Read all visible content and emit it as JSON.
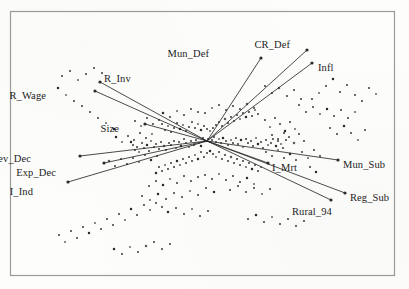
{
  "figure": {
    "kind": "biplot",
    "frame": {
      "x": 10,
      "y": 11,
      "width": 385,
      "height": 265,
      "color": "#9a9a9a"
    },
    "background_color": "#fdfdfc",
    "point_color": "#1a1a1a",
    "vector_color": "#2b2b2b"
  },
  "chart_data": {
    "type": "scatter",
    "title": "",
    "subtitle": "",
    "xlabel": "",
    "ylabel": "",
    "grid": false,
    "legend": "none",
    "axis_ticks_visible": false,
    "origin_px": [
      207,
      141
    ],
    "xlim": [
      10,
      395
    ],
    "ylim": [
      11,
      276
    ],
    "variable_labels": [
      "Mun_Def",
      "CR_Def",
      "Infl",
      "R_Inv",
      "R_Wage",
      "Size",
      "Rev_Dec",
      "Exp_Dec",
      "I_Ind",
      "I_Mrt",
      "Mun_Sub",
      "Reg_Sub",
      "Rural_94"
    ],
    "loading_vectors": [
      {
        "label": "Mun_Def",
        "tip_px": [
          261,
          58
        ],
        "label_px": [
          209,
          54
        ],
        "anchor": "end"
      },
      {
        "label": "CR_Def",
        "tip_px": [
          307,
          50
        ],
        "label_px": [
          290,
          45
        ],
        "anchor": "end"
      },
      {
        "label": "Infl",
        "tip_px": [
          312,
          63
        ],
        "label_px": [
          318,
          68
        ],
        "anchor": "start"
      },
      {
        "label": "R_Inv",
        "tip_px": [
          100,
          82
        ],
        "label_px": [
          104,
          79
        ],
        "anchor": "start"
      },
      {
        "label": "R_Wage",
        "tip_px": [
          95,
          91
        ],
        "label_px": [
          46,
          96
        ],
        "anchor": "end"
      },
      {
        "label": "Size",
        "tip_px": [
          145,
          124
        ],
        "label_px": [
          119,
          129
        ],
        "anchor": "end"
      },
      {
        "label": "Rev_Dec",
        "tip_px": [
          80,
          156
        ],
        "label_px": [
          31,
          159
        ],
        "anchor": "end"
      },
      {
        "label": "Exp_Dec",
        "tip_px": [
          104,
          163
        ],
        "label_px": [
          56,
          173
        ],
        "anchor": "end"
      },
      {
        "label": "I_Ind",
        "tip_px": [
          68,
          182
        ],
        "label_px": [
          33,
          192
        ],
        "anchor": "end"
      },
      {
        "label": "I_Mrt",
        "tip_px": [
          268,
          163
        ],
        "label_px": [
          272,
          168
        ],
        "anchor": "start"
      },
      {
        "label": "Mun_Sub",
        "tip_px": [
          338,
          160
        ],
        "label_px": [
          343,
          165
        ],
        "anchor": "start"
      },
      {
        "label": "Reg_Sub",
        "tip_px": [
          345,
          193
        ],
        "label_px": [
          350,
          198
        ],
        "anchor": "start"
      },
      {
        "label": "Rural_94",
        "tip_px": [
          331,
          200
        ],
        "label_px": [
          292,
          212
        ],
        "anchor": "start"
      }
    ],
    "n_points": 252,
    "points_px": [
      [
        205,
        141
      ],
      [
        208,
        139
      ],
      [
        210,
        142
      ],
      [
        203,
        138
      ],
      [
        212,
        140
      ],
      [
        199,
        143
      ],
      [
        214,
        137
      ],
      [
        201,
        146
      ],
      [
        216,
        142
      ],
      [
        196,
        140
      ],
      [
        219,
        139
      ],
      [
        194,
        145
      ],
      [
        221,
        143
      ],
      [
        191,
        141
      ],
      [
        223,
        138
      ],
      [
        189,
        147
      ],
      [
        226,
        141
      ],
      [
        186,
        143
      ],
      [
        228,
        145
      ],
      [
        184,
        139
      ],
      [
        231,
        140
      ],
      [
        181,
        146
      ],
      [
        233,
        143
      ],
      [
        179,
        142
      ],
      [
        236,
        138
      ],
      [
        176,
        148
      ],
      [
        238,
        144
      ],
      [
        174,
        141
      ],
      [
        241,
        140
      ],
      [
        171,
        145
      ],
      [
        243,
        147
      ],
      [
        169,
        143
      ],
      [
        246,
        139
      ],
      [
        166,
        150
      ],
      [
        248,
        143
      ],
      [
        164,
        146
      ],
      [
        251,
        141
      ],
      [
        161,
        142
      ],
      [
        253,
        146
      ],
      [
        159,
        149
      ],
      [
        256,
        138
      ],
      [
        156,
        144
      ],
      [
        258,
        144
      ],
      [
        154,
        147
      ],
      [
        261,
        142
      ],
      [
        151,
        141
      ],
      [
        263,
        148
      ],
      [
        149,
        151
      ],
      [
        266,
        140
      ],
      [
        147,
        145
      ],
      [
        268,
        145
      ],
      [
        144,
        148
      ],
      [
        271,
        143
      ],
      [
        142,
        143
      ],
      [
        273,
        139
      ],
      [
        139,
        152
      ],
      [
        276,
        146
      ],
      [
        137,
        147
      ],
      [
        278,
        141
      ],
      [
        135,
        150
      ],
      [
        281,
        144
      ],
      [
        133,
        145
      ],
      [
        283,
        148
      ],
      [
        131,
        142
      ],
      [
        286,
        140
      ],
      [
        210,
        131
      ],
      [
        213,
        128
      ],
      [
        216,
        125
      ],
      [
        219,
        122
      ],
      [
        222,
        126
      ],
      [
        225,
        119
      ],
      [
        228,
        123
      ],
      [
        231,
        117
      ],
      [
        234,
        121
      ],
      [
        237,
        115
      ],
      [
        240,
        119
      ],
      [
        243,
        113
      ],
      [
        246,
        117
      ],
      [
        249,
        112
      ],
      [
        252,
        116
      ],
      [
        255,
        110
      ],
      [
        258,
        114
      ],
      [
        207,
        129
      ],
      [
        204,
        126
      ],
      [
        201,
        130
      ],
      [
        198,
        124
      ],
      [
        195,
        128
      ],
      [
        192,
        122
      ],
      [
        189,
        127
      ],
      [
        186,
        131
      ],
      [
        183,
        125
      ],
      [
        180,
        129
      ],
      [
        177,
        123
      ],
      [
        174,
        128
      ],
      [
        171,
        132
      ],
      [
        168,
        126
      ],
      [
        165,
        130
      ],
      [
        162,
        124
      ],
      [
        210,
        151
      ],
      [
        213,
        154
      ],
      [
        216,
        157
      ],
      [
        219,
        152
      ],
      [
        222,
        159
      ],
      [
        225,
        155
      ],
      [
        228,
        161
      ],
      [
        231,
        157
      ],
      [
        234,
        163
      ],
      [
        237,
        159
      ],
      [
        240,
        165
      ],
      [
        243,
        161
      ],
      [
        246,
        167
      ],
      [
        249,
        163
      ],
      [
        252,
        169
      ],
      [
        255,
        165
      ],
      [
        258,
        171
      ],
      [
        261,
        167
      ],
      [
        207,
        153
      ],
      [
        204,
        157
      ],
      [
        201,
        152
      ],
      [
        198,
        159
      ],
      [
        195,
        155
      ],
      [
        192,
        161
      ],
      [
        189,
        157
      ],
      [
        186,
        163
      ],
      [
        183,
        159
      ],
      [
        180,
        165
      ],
      [
        177,
        161
      ],
      [
        174,
        167
      ],
      [
        171,
        163
      ],
      [
        168,
        169
      ],
      [
        165,
        165
      ],
      [
        162,
        171
      ],
      [
        159,
        167
      ],
      [
        156,
        173
      ],
      [
        205,
        113
      ],
      [
        212,
        108
      ],
      [
        219,
        105
      ],
      [
        226,
        110
      ],
      [
        233,
        106
      ],
      [
        240,
        109
      ],
      [
        247,
        104
      ],
      [
        254,
        108
      ],
      [
        198,
        112
      ],
      [
        191,
        109
      ],
      [
        184,
        115
      ],
      [
        177,
        111
      ],
      [
        170,
        117
      ],
      [
        163,
        113
      ],
      [
        205,
        175
      ],
      [
        212,
        179
      ],
      [
        219,
        174
      ],
      [
        226,
        180
      ],
      [
        233,
        176
      ],
      [
        240,
        182
      ],
      [
        247,
        178
      ],
      [
        254,
        184
      ],
      [
        198,
        177
      ],
      [
        191,
        181
      ],
      [
        184,
        176
      ],
      [
        177,
        183
      ],
      [
        170,
        179
      ],
      [
        163,
        185
      ],
      [
        156,
        181
      ],
      [
        149,
        186
      ],
      [
        265,
        120
      ],
      [
        270,
        127
      ],
      [
        275,
        118
      ],
      [
        280,
        124
      ],
      [
        285,
        131
      ],
      [
        290,
        122
      ],
      [
        295,
        129
      ],
      [
        272,
        135
      ],
      [
        278,
        139
      ],
      [
        284,
        133
      ],
      [
        289,
        137
      ],
      [
        294,
        143
      ],
      [
        299,
        134
      ],
      [
        304,
        141
      ],
      [
        266,
        152
      ],
      [
        272,
        156
      ],
      [
        278,
        150
      ],
      [
        284,
        158
      ],
      [
        290,
        154
      ],
      [
        296,
        160
      ],
      [
        302,
        152
      ],
      [
        308,
        158
      ],
      [
        314,
        150
      ],
      [
        320,
        156
      ],
      [
        310,
        167
      ],
      [
        316,
        172
      ],
      [
        152,
        134
      ],
      [
        146,
        138
      ],
      [
        140,
        133
      ],
      [
        134,
        140
      ],
      [
        128,
        136
      ],
      [
        122,
        142
      ],
      [
        116,
        137
      ],
      [
        159,
        120
      ],
      [
        153,
        124
      ],
      [
        147,
        118
      ],
      [
        141,
        126
      ],
      [
        135,
        121
      ],
      [
        157,
        156
      ],
      [
        151,
        160
      ],
      [
        145,
        155
      ],
      [
        139,
        162
      ],
      [
        133,
        158
      ],
      [
        127,
        164
      ],
      [
        121,
        159
      ],
      [
        115,
        166
      ],
      [
        109,
        161
      ],
      [
        230,
        190
      ],
      [
        238,
        186
      ],
      [
        246,
        192
      ],
      [
        254,
        188
      ],
      [
        262,
        194
      ],
      [
        270,
        189
      ],
      [
        214,
        192
      ],
      [
        206,
        188
      ],
      [
        198,
        195
      ],
      [
        190,
        191
      ],
      [
        182,
        197
      ],
      [
        174,
        193
      ],
      [
        166,
        199
      ],
      [
        158,
        194
      ],
      [
        150,
        200
      ],
      [
        142,
        196
      ],
      [
        299,
        105
      ],
      [
        306,
        112
      ],
      [
        313,
        107
      ],
      [
        320,
        114
      ],
      [
        327,
        109
      ],
      [
        334,
        116
      ],
      [
        341,
        110
      ],
      [
        348,
        118
      ],
      [
        355,
        112
      ],
      [
        330,
        128
      ],
      [
        337,
        134
      ],
      [
        344,
        126
      ],
      [
        351,
        133
      ],
      [
        358,
        140
      ],
      [
        365,
        130
      ],
      [
        287,
        96
      ],
      [
        294,
        90
      ],
      [
        301,
        99
      ],
      [
        279,
        88
      ],
      [
        272,
        93
      ],
      [
        265,
        86
      ],
      [
        156,
        203
      ],
      [
        162,
        207
      ],
      [
        150,
        210
      ],
      [
        144,
        205
      ],
      [
        168,
        212
      ],
      [
        176,
        208
      ],
      [
        184,
        214
      ],
      [
        192,
        209
      ],
      [
        200,
        216
      ],
      [
        208,
        211
      ],
      [
        137,
        215
      ],
      [
        131,
        209
      ],
      [
        125,
        220
      ],
      [
        119,
        214
      ],
      [
        113,
        225
      ],
      [
        107,
        219
      ],
      [
        101,
        229
      ],
      [
        95,
        223
      ],
      [
        89,
        233
      ],
      [
        83,
        227
      ],
      [
        77,
        238
      ],
      [
        71,
        231
      ],
      [
        65,
        242
      ],
      [
        59,
        235
      ],
      [
        248,
        219
      ],
      [
        256,
        215
      ],
      [
        264,
        222
      ],
      [
        272,
        217
      ],
      [
        280,
        224
      ],
      [
        288,
        219
      ],
      [
        296,
        226
      ],
      [
        304,
        221
      ],
      [
        146,
        246
      ],
      [
        154,
        242
      ],
      [
        162,
        249
      ],
      [
        170,
        244
      ],
      [
        138,
        252
      ],
      [
        130,
        247
      ],
      [
        122,
        254
      ],
      [
        114,
        249
      ],
      [
        62,
        76
      ],
      [
        70,
        71
      ],
      [
        78,
        80
      ],
      [
        86,
        74
      ],
      [
        94,
        68
      ],
      [
        102,
        73
      ],
      [
        58,
        88
      ],
      [
        66,
        95
      ],
      [
        74,
        101
      ],
      [
        82,
        106
      ],
      [
        90,
        112
      ],
      [
        98,
        118
      ],
      [
        106,
        123
      ],
      [
        114,
        129
      ],
      [
        355,
        95
      ],
      [
        362,
        101
      ],
      [
        369,
        88
      ],
      [
        376,
        94
      ],
      [
        347,
        85
      ],
      [
        340,
        92
      ],
      [
        333,
        79
      ],
      [
        326,
        86
      ],
      [
        319,
        93
      ],
      [
        312,
        99
      ]
    ]
  }
}
